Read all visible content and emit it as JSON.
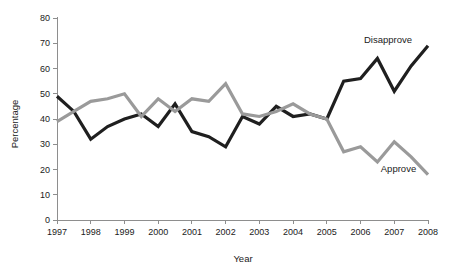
{
  "chart_data": {
    "type": "line",
    "title": "",
    "xlabel": "Year",
    "ylabel": "Percentage",
    "xlim": [
      1997,
      2008
    ],
    "ylim": [
      0,
      80
    ],
    "ytick_step": 10,
    "grid": false,
    "legend_position": "inline-annotation",
    "xticklabels": [
      "1997",
      "1998",
      "1999",
      "2000",
      "2001",
      "2002",
      "2003",
      "2004",
      "2005",
      "2006",
      "2007",
      "2008"
    ],
    "yticklabels": [
      "0",
      "10",
      "20",
      "30",
      "40",
      "50",
      "60",
      "70",
      "80"
    ],
    "colors": {
      "disapprove": "#1f1f1f",
      "approve": "#9a9a9a",
      "axis": "#8e8e8e",
      "text": "#1b1b1b"
    },
    "series": [
      {
        "name": "Disapprove",
        "color": "#1f1f1f",
        "x": [
          1997,
          1997.5,
          1998,
          1998.5,
          1999,
          1999.5,
          2000,
          2000.5,
          2001,
          2001.5,
          2002,
          2002.5,
          2003,
          2003.5,
          2004,
          2004.5,
          2005,
          2005.5,
          2006,
          2006.5,
          2007,
          2007.5,
          2008
        ],
        "values": [
          49,
          43,
          32,
          37,
          40,
          42,
          37,
          46,
          35,
          33,
          29,
          41,
          38,
          45,
          41,
          42,
          40,
          55,
          56,
          64,
          51,
          61,
          69
        ]
      },
      {
        "name": "Approve",
        "color": "#9a9a9a",
        "x": [
          1997,
          1997.5,
          1998,
          1998.5,
          1999,
          1999.5,
          2000,
          2000.5,
          2001,
          2001.5,
          2002,
          2002.5,
          2003,
          2003.5,
          2004,
          2004.5,
          2005,
          2005.5,
          2006,
          2006.5,
          2007,
          2007.5,
          2008
        ],
        "values": [
          39,
          43,
          47,
          48,
          50,
          41,
          48,
          43,
          48,
          47,
          54,
          42,
          41,
          43,
          46,
          42,
          40,
          27,
          29,
          23,
          31,
          25,
          18
        ]
      }
    ],
    "annotations": [
      {
        "text": "Disapprove",
        "x": 2006.1,
        "y": 70
      },
      {
        "text": "Approve",
        "x": 2006.6,
        "y": 19
      }
    ]
  }
}
